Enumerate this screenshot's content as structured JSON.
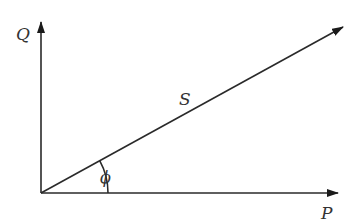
{
  "diagram": {
    "type": "vector-triangle",
    "labels": {
      "q_axis": "Q",
      "p_axis": "P",
      "s_vector": "S",
      "angle": "ϕ"
    },
    "colors": {
      "line": "#2a2a2a",
      "background": "#ffffff"
    }
  }
}
